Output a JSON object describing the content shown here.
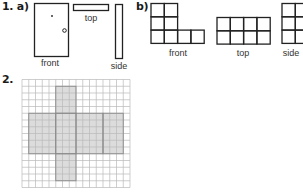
{
  "question1": {
    "number_label": "1.",
    "part_a": {
      "label": "a)",
      "views": {
        "front": "front",
        "top": "top",
        "side": "side"
      },
      "front_features": [
        "dot",
        "circle"
      ]
    },
    "part_b": {
      "label": "b)",
      "views": {
        "front": {
          "label": "front",
          "rows": [
            [
              1,
              1,
              0,
              0
            ],
            [
              1,
              1,
              0,
              0
            ],
            [
              1,
              1,
              1,
              1
            ]
          ]
        },
        "top": {
          "label": "top",
          "rows": [
            [
              1,
              1,
              1,
              1
            ],
            [
              1,
              1,
              1,
              1
            ]
          ]
        },
        "side": {
          "label": "side",
          "rows": [
            [
              1,
              1
            ],
            [
              1,
              1
            ],
            [
              1,
              1
            ]
          ]
        }
      }
    }
  },
  "question2": {
    "number_label": "2.",
    "grid": {
      "columns": 16,
      "rows": 16
    },
    "net": {
      "shaded_color": "#dcdcdc",
      "faces": [
        {
          "name": "top-arm",
          "col": 5,
          "row": 1,
          "w": 3,
          "h": 4
        },
        {
          "name": "left-face",
          "col": 1,
          "row": 5,
          "w": 4,
          "h": 6
        },
        {
          "name": "center-face",
          "col": 5,
          "row": 5,
          "w": 3,
          "h": 6
        },
        {
          "name": "right-face",
          "col": 8,
          "row": 5,
          "w": 4,
          "h": 6
        },
        {
          "name": "far-right-face",
          "col": 12,
          "row": 5,
          "w": 3,
          "h": 6
        },
        {
          "name": "bottom-arm",
          "col": 5,
          "row": 11,
          "w": 3,
          "h": 4
        }
      ]
    }
  }
}
